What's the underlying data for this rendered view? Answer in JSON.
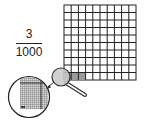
{
  "fraction": {
    "numerator": "3",
    "denominator": "1000"
  },
  "grid": {
    "rows": 10,
    "cols": 10,
    "shaded_cells": [
      [
        9,
        0
      ],
      [
        9,
        1
      ],
      [
        9,
        2
      ]
    ],
    "shade_color": "#9a9a9a",
    "line_color": "#222222"
  },
  "magnifier": {
    "lens_fill": "#c8c8c8",
    "stroke": "#333333"
  },
  "zoom_circle": {
    "fine_grid_color": "#555555",
    "fill": "#b0b0b0"
  }
}
